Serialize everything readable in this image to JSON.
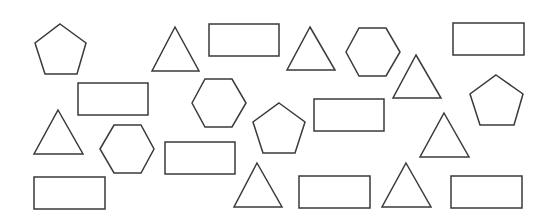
{
  "canvas": {
    "width": 553,
    "height": 218,
    "background": "#ffffff",
    "stroke_color": "#3a3a3a"
  },
  "shapes": [
    {
      "type": "pentagon",
      "points": "60,24 86,43 77,74 45,74 35,43"
    },
    {
      "type": "triangle",
      "points": "175,27 199,71 152,71"
    },
    {
      "type": "rectangle",
      "points": "209,24 279,24 279,56 209,56"
    },
    {
      "type": "triangle",
      "points": "310,27 335,70 287,70"
    },
    {
      "type": "hexagon",
      "points": "346,52 359,28 386,28 400,52 386,76 359,76"
    },
    {
      "type": "rectangle",
      "points": "453,23 524,23 524,55 453,55"
    },
    {
      "type": "rectangle",
      "points": "78,83 148,83 148,115 78,115"
    },
    {
      "type": "hexagon",
      "points": "192,103 205,79 232,79 246,103 232,127 205,127"
    },
    {
      "type": "triangle",
      "points": "416,55 441,98 393,98"
    },
    {
      "type": "pentagon",
      "points": "496,75 523,94 514,125 480,125 470,94"
    },
    {
      "type": "pentagon",
      "points": "279,103 305,122 295,153 263,153 253,122"
    },
    {
      "type": "rectangle",
      "points": "314,99 384,99 384,131 314,131"
    },
    {
      "type": "triangle",
      "points": "58,110 83,154 34,154"
    },
    {
      "type": "hexagon",
      "points": "100,149 114,125 141,125 154,149 141,173 114,173"
    },
    {
      "type": "rectangle",
      "points": "165,142 235,142 235,174 165,174"
    },
    {
      "type": "triangle",
      "points": "444,113 469,157 420,157"
    },
    {
      "type": "rectangle",
      "points": "34,177 105,177 105,209 34,209"
    },
    {
      "type": "triangle",
      "points": "257,163 282,207 234,207"
    },
    {
      "type": "rectangle",
      "points": "299,176 370,176 370,208 299,208"
    },
    {
      "type": "triangle",
      "points": "406,163 431,207 382,207"
    },
    {
      "type": "rectangle",
      "points": "451,176 522,176 522,208 451,208"
    }
  ],
  "counts": {
    "triangle": 7,
    "rectangle": 8,
    "pentagon": 3,
    "hexagon": 3
  }
}
